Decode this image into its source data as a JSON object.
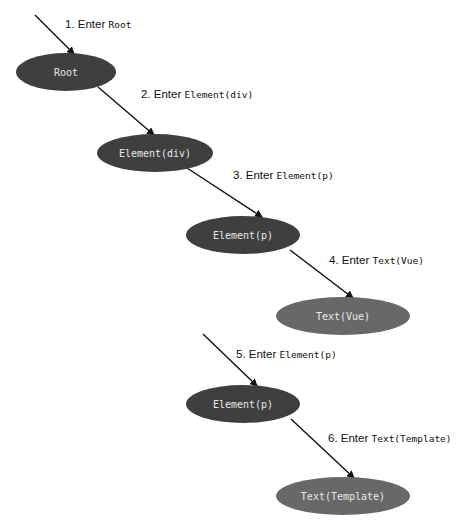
{
  "colors": {
    "element_node": "#3f3f3f",
    "text_node": "#686868",
    "node_text": "#e8e8e8",
    "arrow": "#111111",
    "background": "#ffffff"
  },
  "nodes": [
    {
      "id": "root",
      "label": "Root",
      "kind": "element",
      "cx": 66,
      "cy": 72,
      "rx": 50,
      "ry": 19
    },
    {
      "id": "element-div",
      "label": "Element(div)",
      "kind": "element",
      "cx": 155,
      "cy": 153,
      "rx": 58,
      "ry": 19
    },
    {
      "id": "element-p-1",
      "label": "Element(p)",
      "kind": "element",
      "cx": 243,
      "cy": 235,
      "rx": 57,
      "ry": 19
    },
    {
      "id": "text-vue",
      "label": "Text(Vue)",
      "kind": "text",
      "cx": 343,
      "cy": 316,
      "rx": 67,
      "ry": 19
    },
    {
      "id": "element-p-2",
      "label": "Element(p)",
      "kind": "element",
      "cx": 243,
      "cy": 404,
      "rx": 57,
      "ry": 19
    },
    {
      "id": "text-template",
      "label": "Text(Template)",
      "kind": "text",
      "cx": 343,
      "cy": 496,
      "rx": 67,
      "ry": 19
    }
  ],
  "steps": [
    {
      "number": "1.",
      "verb": "Enter",
      "target": "Root",
      "x1": 35,
      "y1": 15,
      "x2": 74,
      "y2": 54,
      "lx": 65,
      "ly": 28
    },
    {
      "number": "2.",
      "verb": "Enter",
      "target": "Element(div)",
      "x1": 98,
      "y1": 87,
      "x2": 154,
      "y2": 135,
      "lx": 141,
      "ly": 98
    },
    {
      "number": "3.",
      "verb": "Enter",
      "target": "Element(p)",
      "x1": 187,
      "y1": 168,
      "x2": 262,
      "y2": 217,
      "lx": 233,
      "ly": 179
    },
    {
      "number": "4.",
      "verb": "Enter",
      "target": "Text(Vue)",
      "x1": 290,
      "y1": 250,
      "x2": 353,
      "y2": 298,
      "lx": 329,
      "ly": 264
    },
    {
      "number": "5.",
      "verb": "Enter",
      "target": "Element(p)",
      "x1": 203,
      "y1": 334,
      "x2": 257,
      "y2": 386,
      "lx": 236,
      "ly": 358
    },
    {
      "number": "6.",
      "verb": "Enter",
      "target": "Text(Template)",
      "x1": 291,
      "y1": 419,
      "x2": 354,
      "y2": 478,
      "lx": 328,
      "ly": 442
    }
  ]
}
